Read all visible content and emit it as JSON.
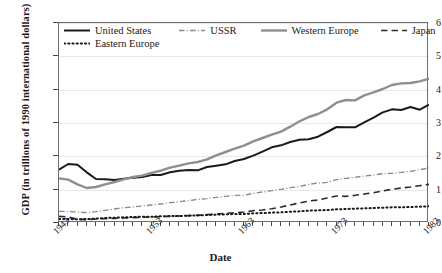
{
  "chart_data": {
    "type": "line",
    "title": "",
    "xlabel": "Date",
    "ylabel": "GDP (in trillions of 1990 international dollars)",
    "xlim": [
      1943,
      1983
    ],
    "ylim": [
      0,
      6
    ],
    "yticks": [
      0,
      1,
      2,
      3,
      4,
      5,
      6
    ],
    "xticks_labeled": [
      1943,
      1953,
      1963,
      1973,
      1983
    ],
    "xtick_step": 1,
    "grid": "horizontal",
    "legend_position": "top-left-inside",
    "x": [
      1943,
      1944,
      1945,
      1946,
      1947,
      1948,
      1949,
      1950,
      1951,
      1952,
      1953,
      1954,
      1955,
      1956,
      1957,
      1958,
      1959,
      1960,
      1961,
      1962,
      1963,
      1964,
      1965,
      1966,
      1967,
      1968,
      1969,
      1970,
      1971,
      1972,
      1973,
      1974,
      1975,
      1976,
      1977,
      1978,
      1979,
      1980,
      1981,
      1982,
      1983
    ],
    "series": [
      {
        "name": "United States",
        "style": "solid",
        "color": "#1a1a1a",
        "width": 2.0,
        "values": [
          1.6,
          1.77,
          1.75,
          1.52,
          1.32,
          1.31,
          1.29,
          1.33,
          1.36,
          1.38,
          1.44,
          1.44,
          1.52,
          1.57,
          1.59,
          1.58,
          1.68,
          1.72,
          1.76,
          1.86,
          1.92,
          2.02,
          2.14,
          2.27,
          2.33,
          2.43,
          2.5,
          2.51,
          2.59,
          2.73,
          2.88,
          2.87,
          2.87,
          3.02,
          3.16,
          3.32,
          3.41,
          3.39,
          3.48,
          3.4,
          3.55
        ]
      },
      {
        "name": "USSR",
        "style": "dash-dot",
        "color": "#8a8a8a",
        "width": 1.4,
        "values": [
          0.35,
          0.35,
          0.33,
          0.31,
          0.34,
          0.38,
          0.42,
          0.46,
          0.48,
          0.51,
          0.54,
          0.57,
          0.61,
          0.64,
          0.67,
          0.71,
          0.73,
          0.77,
          0.8,
          0.83,
          0.83,
          0.89,
          0.93,
          0.97,
          1.01,
          1.06,
          1.09,
          1.16,
          1.2,
          1.22,
          1.3,
          1.34,
          1.37,
          1.41,
          1.44,
          1.48,
          1.49,
          1.52,
          1.55,
          1.6,
          1.65
        ]
      },
      {
        "name": "Western Europe",
        "style": "solid",
        "color": "#8f8f8f",
        "width": 2.4,
        "values": [
          1.34,
          1.3,
          1.16,
          1.05,
          1.08,
          1.16,
          1.23,
          1.31,
          1.38,
          1.42,
          1.5,
          1.57,
          1.66,
          1.72,
          1.79,
          1.83,
          1.91,
          2.03,
          2.13,
          2.23,
          2.32,
          2.45,
          2.55,
          2.65,
          2.74,
          2.89,
          3.05,
          3.18,
          3.27,
          3.41,
          3.61,
          3.69,
          3.68,
          3.83,
          3.92,
          4.02,
          4.14,
          4.19,
          4.2,
          4.25,
          4.33
        ]
      },
      {
        "name": "Japan",
        "style": "dashed",
        "color": "#2a2a2a",
        "width": 1.6,
        "values": [
          0.2,
          0.18,
          0.11,
          0.1,
          0.12,
          0.13,
          0.14,
          0.15,
          0.16,
          0.17,
          0.18,
          0.19,
          0.2,
          0.21,
          0.22,
          0.23,
          0.25,
          0.27,
          0.29,
          0.31,
          0.33,
          0.37,
          0.39,
          0.43,
          0.48,
          0.54,
          0.6,
          0.66,
          0.69,
          0.75,
          0.81,
          0.8,
          0.83,
          0.87,
          0.91,
          0.96,
          1.01,
          1.05,
          1.08,
          1.12,
          1.16
        ]
      },
      {
        "name": "Eastern Europe",
        "style": "dotted",
        "color": "#1a1a1a",
        "width": 2.0,
        "values": [
          0.12,
          0.12,
          0.11,
          0.12,
          0.13,
          0.15,
          0.16,
          0.17,
          0.18,
          0.19,
          0.19,
          0.2,
          0.21,
          0.21,
          0.22,
          0.23,
          0.24,
          0.25,
          0.26,
          0.27,
          0.27,
          0.29,
          0.3,
          0.31,
          0.32,
          0.34,
          0.35,
          0.37,
          0.38,
          0.39,
          0.41,
          0.42,
          0.43,
          0.44,
          0.45,
          0.46,
          0.47,
          0.47,
          0.48,
          0.49,
          0.5
        ]
      }
    ]
  },
  "axis": {
    "y_title": "GDP (in trillions of 1990 international dollars)",
    "x_title": "Date",
    "y_labels": [
      "6",
      "5",
      "4",
      "3",
      "2",
      "1",
      "0"
    ],
    "x_labels": [
      "1943",
      "1953",
      "1963",
      "1973",
      "1983"
    ]
  },
  "legend": {
    "row1": [
      {
        "label": "United States",
        "swatch": "solid-black"
      },
      {
        "label": "USSR",
        "swatch": "dash-dot-gray"
      },
      {
        "label": "Western Europe",
        "swatch": "solid-gray"
      },
      {
        "label": "Japan",
        "swatch": "dashed-black"
      }
    ],
    "row2": [
      {
        "label": "Eastern Europe",
        "swatch": "dotted-black"
      }
    ]
  }
}
